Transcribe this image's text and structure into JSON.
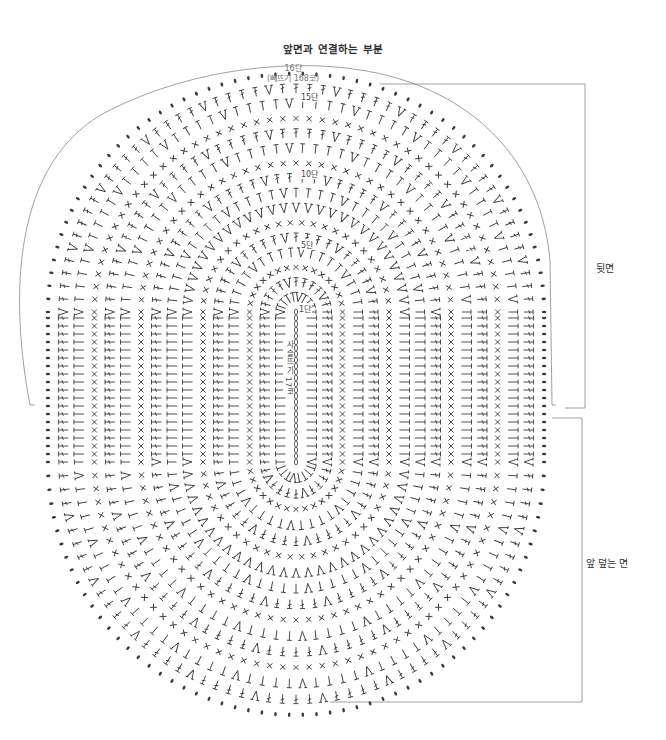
{
  "diagram": {
    "title": "앞면과 연결하는 부분",
    "top_note": {
      "round": "16단",
      "stitch_count": "(빼뜨기 168코)"
    },
    "round_markers": [
      {
        "label": "15단",
        "x": 300,
        "y": 97
      },
      {
        "label": "10단",
        "x": 300,
        "y": 174
      },
      {
        "label": "5단",
        "x": 300,
        "y": 245
      },
      {
        "label": "1단",
        "x": 298,
        "y": 309
      }
    ],
    "foundation_chain_label": "사슬뜨기 17코",
    "side_labels": {
      "back": "뒷면",
      "front_cover": "앞 덮는 면"
    },
    "symbols": {
      "chain": "chain-dot",
      "single_crochet": "x-stitch",
      "half_double": "t-stitch",
      "double_crochet": "crossed-t-stitch",
      "increase": "v-stitch",
      "slip_stitch": "filled-dot"
    },
    "colors": {
      "stroke": "#444444",
      "line": "#888888",
      "background": "#ffffff"
    },
    "geometry": {
      "center_x": 296,
      "center_top_y": 312,
      "center_bottom_y": 462,
      "rounds": 16,
      "outer_rx": 270,
      "outer_ry_top": 250,
      "outer_ry_bottom": 262
    }
  }
}
